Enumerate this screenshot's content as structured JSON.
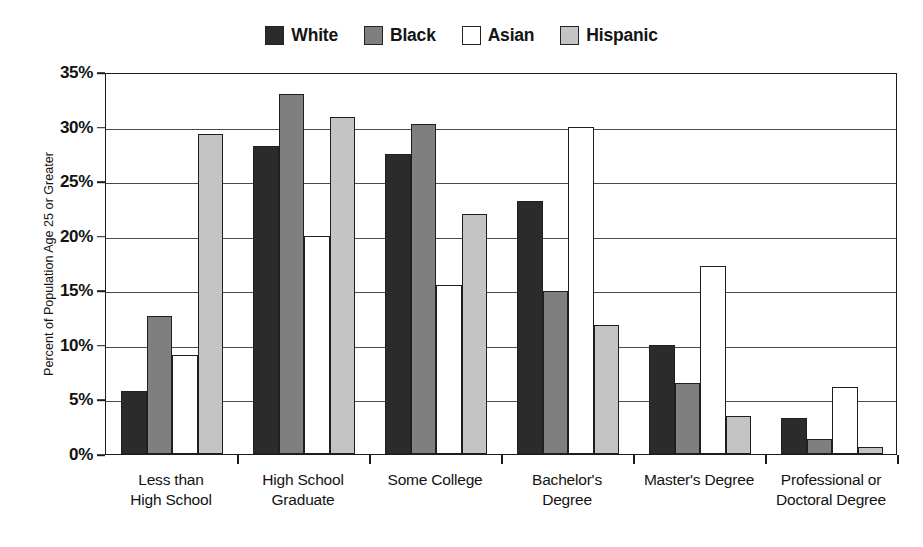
{
  "chart_data": {
    "type": "bar",
    "title": "",
    "xlabel": "",
    "ylabel": "Percent of Population Age 25 or Greater",
    "ylim": [
      0,
      35
    ],
    "ytick_labels": [
      "0%",
      "5%",
      "10%",
      "15%",
      "20%",
      "25%",
      "30%",
      "35%"
    ],
    "ytick_values": [
      0,
      5,
      10,
      15,
      20,
      25,
      30,
      35
    ],
    "grid": true,
    "legend_position": "top-center",
    "categories": [
      "Less than\nHigh School",
      "High School\nGraduate",
      "Some College",
      "Bachelor's\nDegree",
      "Master's Degree",
      "Professional or\nDoctoral Degree"
    ],
    "series": [
      {
        "name": "White",
        "color": "#2b2b2b",
        "values": [
          5.8,
          28.2,
          27.5,
          23.2,
          10.0,
          3.3
        ]
      },
      {
        "name": "Black",
        "color": "#7f7f7f",
        "values": [
          12.6,
          33.0,
          30.2,
          14.9,
          6.5,
          1.4
        ]
      },
      {
        "name": "Asian",
        "color": "#ffffff",
        "values": [
          9.1,
          20.0,
          15.5,
          30.0,
          17.2,
          6.1
        ]
      },
      {
        "name": "Hispanic",
        "color": "#c4c4c4",
        "values": [
          29.3,
          30.9,
          22.0,
          11.8,
          3.5,
          0.6
        ]
      }
    ]
  },
  "legend": {
    "items": [
      {
        "label": "White"
      },
      {
        "label": "Black"
      },
      {
        "label": "Asian"
      },
      {
        "label": "Hispanic"
      }
    ]
  },
  "axis": {
    "y_title": "Percent of Population Age 25 or Greater",
    "categories_display": [
      [
        "Less than",
        "High School"
      ],
      [
        "High School",
        "Graduate"
      ],
      [
        "Some College",
        ""
      ],
      [
        "Bachelor's",
        "Degree"
      ],
      [
        "Master's Degree",
        ""
      ],
      [
        "Professional or",
        "Doctoral Degree"
      ]
    ]
  }
}
